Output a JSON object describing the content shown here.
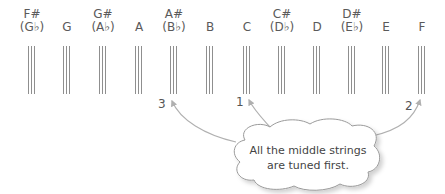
{
  "notes": [
    {
      "sharp": "F#",
      "name": "(G♭)",
      "x": 32
    },
    {
      "sharp": "",
      "name": "G",
      "x": 67
    },
    {
      "sharp": "G#",
      "name": "(A♭)",
      "x": 103
    },
    {
      "sharp": "",
      "name": "A",
      "x": 139
    },
    {
      "sharp": "A#",
      "name": "(B♭)",
      "x": 174
    },
    {
      "sharp": "",
      "name": "B",
      "x": 210
    },
    {
      "sharp": "",
      "name": "C",
      "x": 247
    },
    {
      "sharp": "C#",
      "name": "(D♭)",
      "x": 282
    },
    {
      "sharp": "",
      "name": "D",
      "x": 317
    },
    {
      "sharp": "D#",
      "name": "(E♭)",
      "x": 352
    },
    {
      "sharp": "",
      "name": "E",
      "x": 386
    },
    {
      "sharp": "",
      "name": "F",
      "x": 422
    }
  ],
  "tuning_order": [
    {
      "label": "3",
      "x": 160,
      "y": 98
    },
    {
      "label": "1",
      "x": 237,
      "y": 96
    },
    {
      "label": "2",
      "x": 406,
      "y": 99
    }
  ],
  "callout": {
    "line1": "All the middle strings",
    "line2": "are tuned first."
  },
  "colors": {
    "text": "#555555",
    "strings": "#8f8f8f",
    "arrows": "#b0b0b0",
    "cloud_border": "#9a9a9a"
  }
}
